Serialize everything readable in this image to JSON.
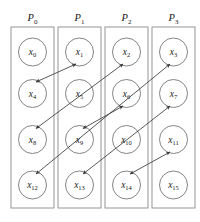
{
  "figure": {
    "type": "diagram",
    "canvas": {
      "width": 200,
      "height": 222,
      "background": "#ffffff"
    },
    "colors": {
      "box_stroke": "#8a8a8a",
      "circle_stroke": "#6e6e6e",
      "arrow_stroke": "#3a3a3a",
      "text": "#1a1a1a",
      "background": "#ffffff"
    },
    "processors": [
      {
        "id": "p0",
        "base": "P",
        "sub": "0",
        "label": "P0",
        "box": {
          "x": 11,
          "y": 27,
          "w": 43,
          "h": 181
        }
      },
      {
        "id": "p1",
        "base": "P",
        "sub": "1",
        "label": "P1",
        "box": {
          "x": 58,
          "y": 27,
          "w": 43,
          "h": 181
        }
      },
      {
        "id": "p2",
        "base": "P",
        "sub": "2",
        "label": "P2",
        "box": {
          "x": 105,
          "y": 27,
          "w": 43,
          "h": 181
        }
      },
      {
        "id": "p3",
        "base": "P",
        "sub": "3",
        "label": "P3",
        "box": {
          "x": 152,
          "y": 27,
          "w": 43,
          "h": 181
        }
      }
    ],
    "nodes": [
      {
        "id": "x0",
        "base": "x",
        "sub": "0",
        "label": "x0",
        "col": 0,
        "row": 0,
        "cx": 32.5,
        "cy": 52,
        "r": 14
      },
      {
        "id": "x1",
        "base": "x",
        "sub": "1",
        "label": "x1",
        "col": 1,
        "row": 0,
        "cx": 79.5,
        "cy": 52,
        "r": 14
      },
      {
        "id": "x2",
        "base": "x",
        "sub": "2",
        "label": "x2",
        "col": 2,
        "row": 0,
        "cx": 126.5,
        "cy": 52,
        "r": 14
      },
      {
        "id": "x3",
        "base": "x",
        "sub": "3",
        "label": "x3",
        "col": 3,
        "row": 0,
        "cx": 173.5,
        "cy": 52,
        "r": 14
      },
      {
        "id": "x4",
        "base": "x",
        "sub": "4",
        "label": "x4",
        "col": 0,
        "row": 1,
        "cx": 32.5,
        "cy": 93.5,
        "r": 14
      },
      {
        "id": "x5",
        "base": "x",
        "sub": "5",
        "label": "x5",
        "col": 1,
        "row": 1,
        "cx": 79.5,
        "cy": 93.5,
        "r": 14
      },
      {
        "id": "x6",
        "base": "x",
        "sub": "6",
        "label": "x6",
        "col": 2,
        "row": 1,
        "cx": 126.5,
        "cy": 93.5,
        "r": 14
      },
      {
        "id": "x7",
        "base": "x",
        "sub": "7",
        "label": "x7",
        "col": 3,
        "row": 1,
        "cx": 173.5,
        "cy": 93.5,
        "r": 14
      },
      {
        "id": "x8",
        "base": "x",
        "sub": "8",
        "label": "x8",
        "col": 0,
        "row": 2,
        "cx": 32.5,
        "cy": 139.5,
        "r": 14
      },
      {
        "id": "x9",
        "base": "x",
        "sub": "9",
        "label": "x9",
        "col": 1,
        "row": 2,
        "cx": 79.5,
        "cy": 139.5,
        "r": 14
      },
      {
        "id": "x10",
        "base": "x",
        "sub": "10",
        "label": "x10",
        "col": 2,
        "row": 2,
        "cx": 126.5,
        "cy": 139.5,
        "r": 14
      },
      {
        "id": "x11",
        "base": "x",
        "sub": "11",
        "label": "x11",
        "col": 3,
        "row": 2,
        "cx": 173.5,
        "cy": 139.5,
        "r": 14
      },
      {
        "id": "x12",
        "base": "x",
        "sub": "12",
        "label": "x12",
        "col": 0,
        "row": 3,
        "cx": 32.5,
        "cy": 185,
        "r": 14
      },
      {
        "id": "x13",
        "base": "x",
        "sub": "13",
        "label": "x13",
        "col": 1,
        "row": 3,
        "cx": 79.5,
        "cy": 185,
        "r": 14
      },
      {
        "id": "x14",
        "base": "x",
        "sub": "14",
        "label": "x14",
        "col": 2,
        "row": 3,
        "cx": 126.5,
        "cy": 185,
        "r": 14
      },
      {
        "id": "x15",
        "base": "x",
        "sub": "15",
        "label": "x15",
        "col": 3,
        "row": 3,
        "cx": 173.5,
        "cy": 185,
        "r": 14
      }
    ],
    "swaps": [
      {
        "id": "swap-x4-x1",
        "from": "x4",
        "to": "x1",
        "x1": 36,
        "y1": 82,
        "x2": 76,
        "y2": 64,
        "double_headed": true
      },
      {
        "id": "swap-x8-x2",
        "from": "x8",
        "to": "x2",
        "x1": 36,
        "y1": 128.5,
        "x2": 123,
        "y2": 64,
        "double_headed": true
      },
      {
        "id": "swap-x12-x3",
        "from": "x12",
        "to": "x3",
        "x1": 36,
        "y1": 174,
        "x2": 170,
        "y2": 64,
        "double_headed": true
      },
      {
        "id": "swap-x9-x6",
        "from": "x9",
        "to": "x6",
        "x1": 83,
        "y1": 128.5,
        "x2": 123,
        "y2": 106,
        "double_headed": true
      },
      {
        "id": "swap-x13-x7",
        "from": "x13",
        "to": "x7",
        "x1": 83,
        "y1": 174,
        "x2": 170,
        "y2": 106,
        "double_headed": true
      },
      {
        "id": "swap-x14-x11",
        "from": "x14",
        "to": "x11",
        "x1": 130,
        "y1": 174,
        "x2": 170,
        "y2": 152,
        "double_headed": true
      }
    ]
  }
}
